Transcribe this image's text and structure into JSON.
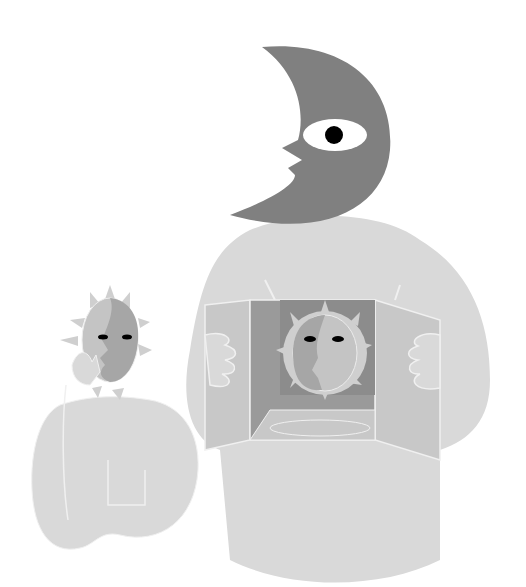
{
  "illustration": {
    "title": "",
    "colors": {
      "background": "#ffffff",
      "moon": "#808080",
      "body_light": "#d9d9d9",
      "body_outline": "#f0f0f0",
      "box_dark": "#9a9a9a",
      "box_mid": "#bcbcbc",
      "sun_face_dark": "#a6a6a6",
      "sun_face_light": "#c4c4c4",
      "sun_rays": "#cfcfcf",
      "eye_white": "#ffffff",
      "pupil": "#000000"
    },
    "elements": [
      "crescent-moon-face",
      "large-figure-body",
      "open-box",
      "sun-face-in-box",
      "small-figure",
      "small-sun-face"
    ]
  }
}
